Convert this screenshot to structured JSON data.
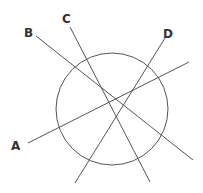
{
  "diagram": {
    "circle": {
      "cx": 112,
      "cy": 109,
      "r": 56
    },
    "lines": [
      {
        "label": "A",
        "x1": 28,
        "y1": 143,
        "x2": 189,
        "y2": 62,
        "lx": 11,
        "ly": 150
      },
      {
        "label": "B",
        "x1": 36,
        "y1": 36,
        "x2": 193,
        "y2": 160,
        "lx": 24,
        "ly": 37
      },
      {
        "label": "C",
        "x1": 70,
        "y1": 27,
        "x2": 150,
        "y2": 182,
        "lx": 62,
        "ly": 23
      },
      {
        "label": "D",
        "x1": 165,
        "y1": 38,
        "x2": 75,
        "y2": 183,
        "lx": 163,
        "ly": 38
      }
    ],
    "stroke_color": "#555555"
  }
}
